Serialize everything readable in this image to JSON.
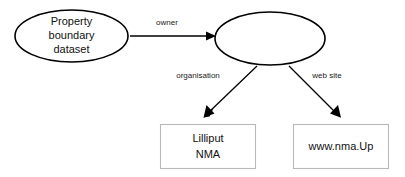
{
  "diagram": {
    "background_color": "#ffffff",
    "stroke_color": "#000000",
    "box_stroke_color": "#b9b9b9",
    "nodes": [
      {
        "id": "property-boundary-dataset",
        "shape": "ellipse",
        "lines": [
          "Property",
          "boundary",
          "dataset"
        ],
        "line1": "Property",
        "line2": "boundary",
        "line3": "dataset"
      },
      {
        "id": "owner-entity",
        "shape": "ellipse",
        "lines": [],
        "label": ""
      },
      {
        "id": "lilliput-nma",
        "shape": "box",
        "lines": [
          "Lilliput",
          "NMA"
        ],
        "line1": "Lilliput",
        "line2": "NMA"
      },
      {
        "id": "web-site-value",
        "shape": "box",
        "lines": [
          "www.nma.Up"
        ],
        "line1": "www.nma.Up"
      }
    ],
    "edges": [
      {
        "id": "edge-owner",
        "label": "owner",
        "from": "property-boundary-dataset",
        "to": "owner-entity",
        "arrow": true
      },
      {
        "id": "edge-organisation",
        "label": "organisation",
        "from": "owner-entity",
        "to": "lilliput-nma",
        "arrow": true
      },
      {
        "id": "edge-web-site",
        "label": "web site",
        "from": "owner-entity",
        "to": "web-site-value",
        "arrow": true
      }
    ]
  }
}
